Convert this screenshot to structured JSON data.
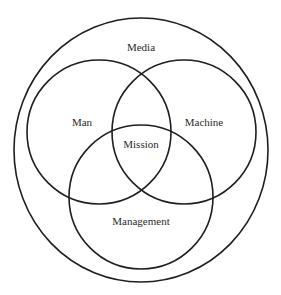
{
  "diagram": {
    "type": "venn",
    "outer_set": {
      "label": "Media",
      "shape": {
        "cx": 141,
        "cy": 150,
        "rx": 127,
        "ry": 132
      },
      "label_pos": {
        "x": 141,
        "y": 51
      }
    },
    "sets": [
      {
        "label": "Man",
        "shape": {
          "cx": 99,
          "cy": 132,
          "r": 72
        },
        "label_pos": {
          "x": 82,
          "y": 126
        }
      },
      {
        "label": "Machine",
        "shape": {
          "cx": 184,
          "cy": 132,
          "r": 72
        },
        "label_pos": {
          "x": 204,
          "y": 126
        }
      },
      {
        "label": "Management",
        "shape": {
          "cx": 141,
          "cy": 197,
          "r": 72
        },
        "label_pos": {
          "x": 141,
          "y": 225
        }
      }
    ],
    "intersection": {
      "label": "Mission",
      "label_pos": {
        "x": 141,
        "y": 148
      }
    },
    "stroke_color": "#1e1e1e",
    "text_color": "#2a2a2a",
    "background": "#ffffff"
  }
}
